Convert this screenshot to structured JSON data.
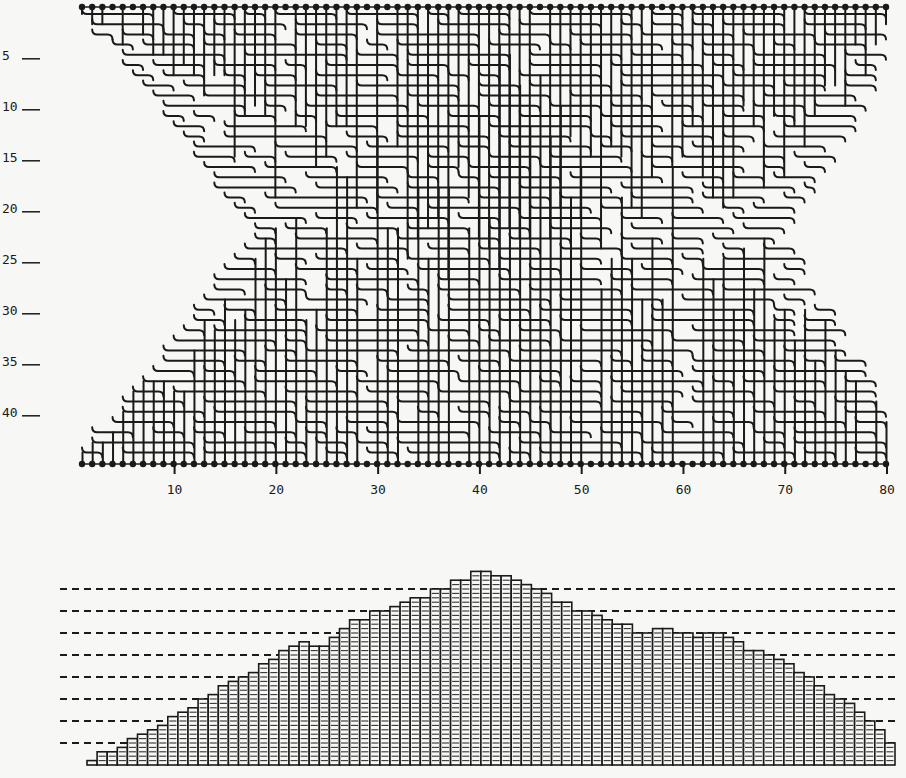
{
  "figure": {
    "routing": {
      "columns": 80,
      "tracks": 44,
      "x_ticks": [
        10,
        20,
        30,
        40,
        50,
        60,
        70,
        80
      ],
      "x_tick_labels": [
        "10",
        "20",
        "30",
        "40",
        "50",
        "60",
        "70",
        "80"
      ],
      "y_ticks": [
        5,
        10,
        15,
        20,
        25,
        30,
        35,
        40
      ],
      "y_tick_labels": [
        "5",
        "10",
        "15",
        "20",
        "25",
        "30",
        "35",
        "40"
      ],
      "line_color": "#1a1a1a",
      "pin_color": "#1a1a1a"
    },
    "density": {
      "dashed_levels": [
        5,
        10,
        15,
        20,
        25,
        30,
        35,
        40
      ]
    }
  },
  "chart_data": [
    {
      "type": "diagram",
      "title": "Channel routing (80 columns, ~44 tracks)",
      "xlabel": "column",
      "ylabel": "track",
      "x_ticks": [
        10,
        20,
        30,
        40,
        50,
        60,
        70,
        80
      ],
      "y_ticks": [
        5,
        10,
        15,
        20,
        25,
        30,
        35,
        40
      ],
      "xlim": [
        1,
        80
      ],
      "ylim": [
        1,
        44
      ]
    },
    {
      "type": "bar",
      "title": "Channel density per column",
      "xlabel": "column",
      "ylabel": "density",
      "categories": [
        1,
        2,
        3,
        4,
        5,
        6,
        7,
        8,
        9,
        10,
        11,
        12,
        13,
        14,
        15,
        16,
        17,
        18,
        19,
        20,
        21,
        22,
        23,
        24,
        25,
        26,
        27,
        28,
        29,
        30,
        31,
        32,
        33,
        34,
        35,
        36,
        37,
        38,
        39,
        40,
        41,
        42,
        43,
        44,
        45,
        46,
        47,
        48,
        49,
        50,
        51,
        52,
        53,
        54,
        55,
        56,
        57,
        58,
        59,
        60,
        61,
        62,
        63,
        64,
        65,
        66,
        67,
        68,
        69,
        70,
        71,
        72,
        73,
        74,
        75,
        76,
        77,
        78,
        79,
        80
      ],
      "values": [
        1,
        3,
        3,
        4,
        6,
        7,
        8,
        9,
        11,
        12,
        13,
        15,
        16,
        18,
        19,
        20,
        21,
        23,
        24,
        26,
        27,
        28,
        27,
        27,
        29,
        31,
        33,
        33,
        35,
        35,
        36,
        37,
        38,
        38,
        40,
        40,
        42,
        42,
        44,
        44,
        43,
        43,
        42,
        41,
        40,
        39,
        37,
        37,
        35,
        35,
        34,
        33,
        32,
        32,
        30,
        30,
        31,
        31,
        30,
        30,
        29,
        30,
        30,
        29,
        28,
        26,
        26,
        25,
        24,
        23,
        21,
        20,
        18,
        16,
        15,
        14,
        12,
        10,
        8,
        5
      ],
      "gridlines_dashed": [
        5,
        10,
        15,
        20,
        25,
        30,
        35,
        40
      ],
      "ylim": [
        0,
        45
      ]
    }
  ]
}
